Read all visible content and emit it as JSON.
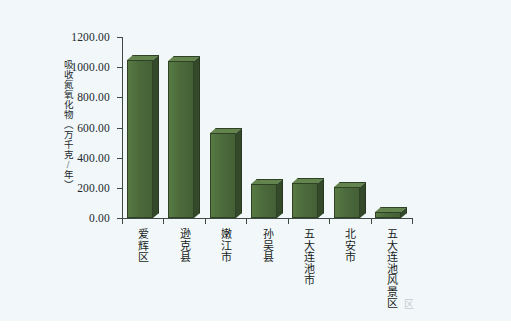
{
  "chart_data": {
    "type": "bar",
    "title": "",
    "xlabel": "",
    "ylabel": "吸收氮氧化物（万千克/年）",
    "categories": [
      "爱辉区",
      "逊克县",
      "嫩江市",
      "孙吴县",
      "五大连池市",
      "北安市",
      "五大连池风景区"
    ],
    "values": [
      1047.0,
      1043.0,
      563.0,
      226.0,
      232.0,
      205.0,
      40.0
    ],
    "ylim": [
      0,
      1200
    ],
    "ytick_values": [
      0,
      200,
      400,
      600,
      800,
      1000,
      1200
    ],
    "ytick_labels": [
      "0.00",
      "200.00",
      "400.00",
      "600.00",
      "800.00",
      "1000.00",
      "1200.00"
    ],
    "grid": false,
    "legend": false,
    "bar_color": "#4c6b3c",
    "bar_top_color": "#63844d",
    "bar_side_color": "#33492a",
    "axis_color": "#3c4a42",
    "background_color": "#f2f8fa"
  },
  "axis": {
    "y_title": "吸收氮氧化物（万千克/年）"
  },
  "footer": {
    "corner_mark": "区"
  }
}
